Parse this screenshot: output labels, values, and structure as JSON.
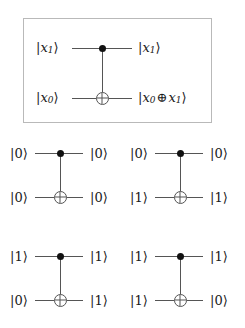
{
  "figure": {
    "type": "quantum-circuit-diagram",
    "colors": {
      "wire": "#555555",
      "control_dot": "#111111",
      "frame_border": "#b9b9b9",
      "background": "#ffffff",
      "text": "#1a1a1a"
    }
  },
  "main_circuit": {
    "name": "cnot-general",
    "framed": true,
    "control_line": {
      "input_label": "|x₁⟩",
      "input_parts": {
        "bar": "|",
        "var": "x",
        "sub": "1",
        "ket": "⟩"
      },
      "output_label": "|x₁⟩",
      "output_parts": {
        "bar": "|",
        "var": "x",
        "sub": "1",
        "ket": "⟩"
      },
      "marker": "control-dot"
    },
    "target_line": {
      "input_label": "|x₀⟩",
      "input_parts": {
        "bar": "|",
        "var": "x",
        "sub": "0",
        "ket": "⟩"
      },
      "output_label": "|x₀ ⊕ x₁⟩",
      "output_parts": {
        "bar": "|",
        "var_a": "x",
        "sub_a": "0",
        "op": "⊕",
        "var_b": "x",
        "sub_b": "1",
        "ket": "⟩"
      },
      "marker": "xor-target"
    }
  },
  "examples": [
    {
      "name": "cnot-example-00",
      "position": "top-left",
      "control_in": "|0⟩",
      "control_out": "|0⟩",
      "target_in": "|0⟩",
      "target_out": "|0⟩"
    },
    {
      "name": "cnot-example-01",
      "position": "top-right",
      "control_in": "|0⟩",
      "control_out": "|0⟩",
      "target_in": "|1⟩",
      "target_out": "|1⟩"
    },
    {
      "name": "cnot-example-10",
      "position": "bottom-left",
      "control_in": "|1⟩",
      "control_out": "|1⟩",
      "target_in": "|0⟩",
      "target_out": "|1⟩"
    },
    {
      "name": "cnot-example-11",
      "position": "bottom-right",
      "control_in": "|1⟩",
      "control_out": "|1⟩",
      "target_in": "|1⟩",
      "target_out": "|0⟩"
    }
  ]
}
